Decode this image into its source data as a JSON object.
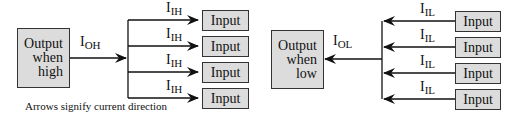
{
  "left_diagram": {
    "output_box": {
      "lines": [
        "Output",
        "when",
        "high"
      ]
    },
    "output_current": {
      "main": "I",
      "sub": "OH"
    },
    "branch_current": {
      "main": "I",
      "sub": "IH"
    },
    "inputs": [
      "Input",
      "Input",
      "Input",
      "Input"
    ],
    "caption": "Arrows signify current direction"
  },
  "right_diagram": {
    "output_box": {
      "lines": [
        "Output",
        "when",
        "low"
      ]
    },
    "output_current": {
      "main": "I",
      "sub": "OL"
    },
    "branch_current": {
      "main": "I",
      "sub": "IL"
    },
    "inputs": [
      "Input",
      "Input",
      "Input",
      "Input"
    ]
  },
  "colors": {
    "box_fill": "#dcdcdc",
    "line": "#111111"
  }
}
